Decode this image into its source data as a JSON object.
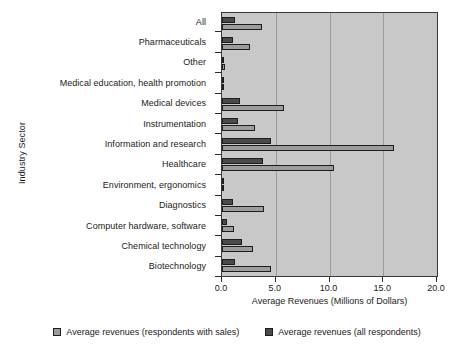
{
  "chart_data": {
    "type": "bar",
    "orientation": "horizontal",
    "title": "",
    "xlabel": "Average Revenues (Millions of Dollars)",
    "ylabel": "Industry Sector",
    "xlim": [
      0.0,
      20.0
    ],
    "xticks": [
      "0.0",
      "5.0",
      "10.0",
      "15.0",
      "20.0"
    ],
    "xtick_values": [
      0.0,
      5.0,
      10.0,
      15.0,
      20.0
    ],
    "grid": true,
    "grid_axis": "x",
    "legend_position": "bottom",
    "categories": [
      "All",
      "Pharmaceuticals",
      "Other",
      "Medical education, health promotion",
      "Medical devices",
      "Instrumentation",
      "Information and research",
      "Healthcare",
      "Environment, ergonomics",
      "Diagnostics",
      "Computer hardware, software",
      "Chemical technology",
      "Biotechnology"
    ],
    "series": [
      {
        "name": "Average revenues (all respondents)",
        "color": "#4a4a4a",
        "values": [
          1.2,
          1.0,
          0.15,
          0.1,
          1.7,
          1.5,
          4.6,
          3.8,
          0.15,
          1.0,
          0.5,
          1.9,
          1.2
        ]
      },
      {
        "name": "Average revenues (respondents with sales)",
        "color": "#9c9c9c",
        "values": [
          3.7,
          2.6,
          0.3,
          0.1,
          5.8,
          3.1,
          16.0,
          10.4,
          0.15,
          3.9,
          1.1,
          2.9,
          4.6
        ]
      }
    ]
  },
  "legend": {
    "items": [
      {
        "label": "Average revenues (respondents with sales)",
        "style": "light"
      },
      {
        "label": "Average revenues (all respondents)",
        "style": "dark"
      }
    ]
  }
}
